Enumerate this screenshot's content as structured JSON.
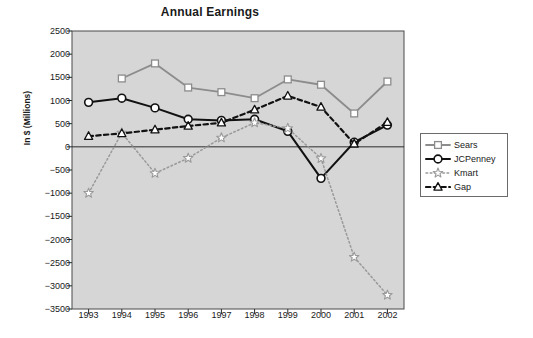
{
  "chart_data": {
    "type": "line",
    "title": "Annual Earnings",
    "xlabel": "",
    "ylabel": "In $ (Millions)",
    "categories": [
      "1993",
      "1994",
      "1995",
      "1996",
      "1997",
      "1998",
      "1999",
      "2000",
      "2001",
      "2002"
    ],
    "x": [
      1993,
      1994,
      1995,
      1996,
      1997,
      1998,
      1999,
      2000,
      2001,
      2002
    ],
    "ylim": [
      -3500,
      2500
    ],
    "yticks": [
      2500,
      2000,
      1500,
      1000,
      500,
      0,
      -500,
      -1000,
      -1500,
      -2000,
      -2500,
      -3000,
      -3500
    ],
    "ytick_labels": [
      "2500",
      "2000",
      "1500",
      "1000",
      "500",
      "0",
      "-500",
      "-1000",
      "-1500",
      "-2000",
      "-2500",
      "-3000",
      "-3500"
    ],
    "grid": false,
    "zero_line": true,
    "legend_position": "right",
    "plot_background": "#d6d6d6",
    "series": [
      {
        "name": "Sears",
        "color": "#8c8c8c",
        "marker": "square",
        "dash": "solid",
        "values": [
          null,
          1475,
          1800,
          1280,
          1180,
          1050,
          1455,
          1340,
          720,
          1410
        ]
      },
      {
        "name": "JCPenney",
        "color": "#111111",
        "marker": "circle",
        "dash": "solid",
        "values": [
          960,
          1050,
          840,
          595,
          570,
          595,
          335,
          -680,
          100,
          470
        ]
      },
      {
        "name": "Kmart",
        "color": "#9a9a9a",
        "marker": "star",
        "dash": "dotted",
        "values": [
          -1000,
          300,
          -570,
          -245,
          195,
          520,
          400,
          -250,
          -2380,
          -3200
        ]
      },
      {
        "name": "Gap",
        "color": "#111111",
        "marker": "triangle",
        "dash": "dashed",
        "values": [
          230,
          290,
          370,
          450,
          520,
          800,
          1100,
          860,
          65,
          530
        ]
      }
    ]
  }
}
